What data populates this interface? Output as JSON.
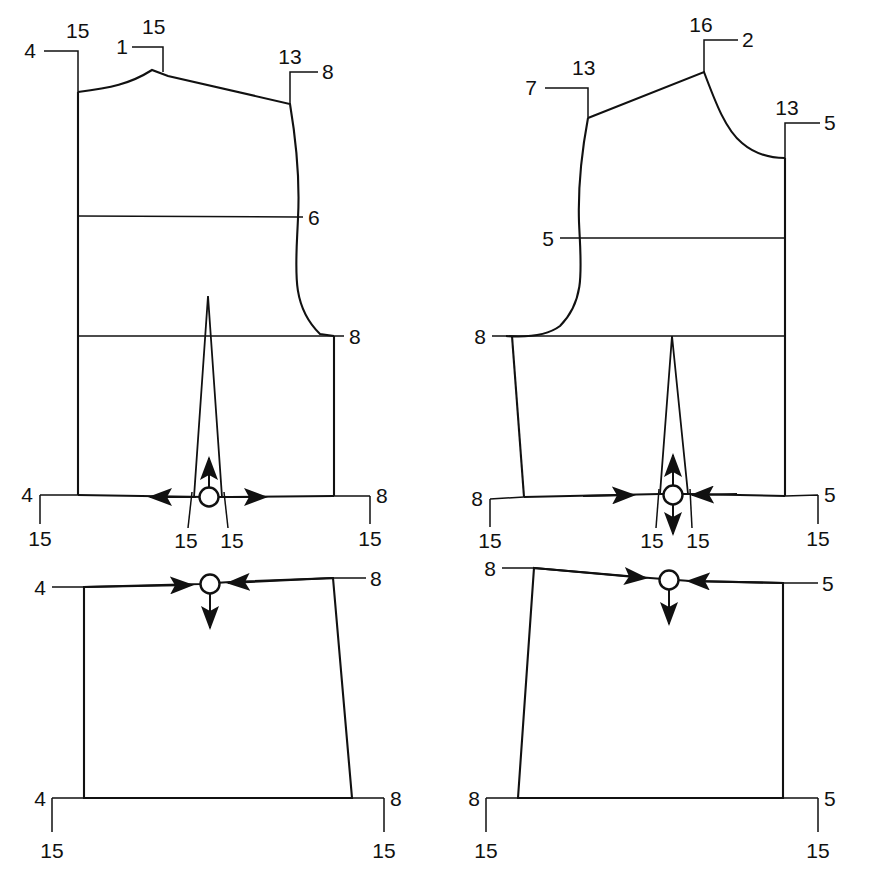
{
  "document": {
    "kind": "sewing-pattern-technical-drawing",
    "background_color": "#ffffff",
    "line_color": "#111111"
  },
  "pieces": [
    {
      "id": "front-bodice",
      "name": "Front bodice block",
      "position": "top-left",
      "callouts": [
        {
          "id": "fb-shoulder-left",
          "number": "4",
          "sub": "15"
        },
        {
          "id": "fb-center-front",
          "number": "1",
          "sub": "15"
        },
        {
          "id": "fb-shoulder-right",
          "number": "13",
          "sub": "8"
        },
        {
          "id": "fb-bust-line",
          "number": "6",
          "sub": ""
        },
        {
          "id": "fb-armhole-base",
          "number": "8",
          "sub": ""
        },
        {
          "id": "fb-waist-left",
          "number": "4",
          "sub": "15"
        },
        {
          "id": "fb-dart-left",
          "number": "",
          "sub": "15"
        },
        {
          "id": "fb-dart-right",
          "number": "",
          "sub": "15"
        },
        {
          "id": "fb-waist-right",
          "number": "8",
          "sub": "15"
        }
      ],
      "grain_marker": {
        "id": "fb-grain",
        "shape": "circle",
        "arrows": [
          "left",
          "right",
          "up"
        ]
      },
      "dart": {
        "id": "fb-waist-dart",
        "type": "waist-dart"
      }
    },
    {
      "id": "back-bodice",
      "name": "Back bodice block",
      "position": "top-right",
      "callouts": [
        {
          "id": "bb-neck-top",
          "number": "16",
          "sub": "2"
        },
        {
          "id": "bb-shoulder-left",
          "number": "7",
          "sub": "13"
        },
        {
          "id": "bb-neck-right",
          "number": "13",
          "sub": "5"
        },
        {
          "id": "bb-bust-line",
          "number": "5",
          "sub": ""
        },
        {
          "id": "bb-armhole-base",
          "number": "8",
          "sub": ""
        },
        {
          "id": "bb-waist-left",
          "number": "8",
          "sub": "15"
        },
        {
          "id": "bb-dart-left",
          "number": "",
          "sub": "15"
        },
        {
          "id": "bb-dart-right",
          "number": "",
          "sub": "15"
        },
        {
          "id": "bb-waist-right",
          "number": "5",
          "sub": "15"
        }
      ],
      "grain_marker": {
        "id": "bb-grain",
        "shape": "circle",
        "arrows": [
          "right-inward",
          "left-inward",
          "up",
          "down"
        ]
      },
      "dart": {
        "id": "bb-waist-dart",
        "type": "waist-dart"
      }
    },
    {
      "id": "front-skirt",
      "name": "Front skirt / lower panel",
      "position": "bottom-left",
      "callouts": [
        {
          "id": "fs-top-left",
          "number": "4",
          "sub": ""
        },
        {
          "id": "fs-top-right",
          "number": "8",
          "sub": ""
        },
        {
          "id": "fs-hem-left",
          "number": "4",
          "sub": "15"
        },
        {
          "id": "fs-hem-right",
          "number": "8",
          "sub": "15"
        }
      ],
      "grain_marker": {
        "id": "fs-grain",
        "shape": "circle",
        "arrows": [
          "right-inward",
          "left-inward",
          "down"
        ]
      }
    },
    {
      "id": "back-skirt",
      "name": "Back skirt / lower panel",
      "position": "bottom-right",
      "callouts": [
        {
          "id": "bs-top-left",
          "number": "8",
          "sub": ""
        },
        {
          "id": "bs-top-right",
          "number": "5",
          "sub": ""
        },
        {
          "id": "bs-hem-left",
          "number": "8",
          "sub": "15"
        },
        {
          "id": "bs-hem-right",
          "number": "5",
          "sub": "15"
        }
      ],
      "grain_marker": {
        "id": "bs-grain",
        "shape": "circle",
        "arrows": [
          "right-inward",
          "left-inward",
          "down"
        ]
      }
    }
  ],
  "labels": {
    "fb_shoulder_left_num": "4",
    "fb_shoulder_left_sub": "15",
    "fb_center_num": "1",
    "fb_center_sub": "15",
    "fb_shoulder_right_num": "13",
    "fb_shoulder_right_sub": "8",
    "fb_bust": "6",
    "fb_armhole": "8",
    "fb_waist_left_num": "4",
    "fb_waist_left_sub": "15",
    "fb_dart_left_sub": "15",
    "fb_dart_right_sub": "15",
    "fb_waist_right_num": "8",
    "fb_waist_right_sub": "15",
    "bb_neck_num": "16",
    "bb_neck_sub": "2",
    "bb_shoulder_left_num": "7",
    "bb_shoulder_left_sub": "13",
    "bb_neck_right_num": "13",
    "bb_neck_right_sub": "5",
    "bb_bust": "5",
    "bb_armhole": "8",
    "bb_waist_left_num": "8",
    "bb_waist_left_sub": "15",
    "bb_dart_left_sub": "15",
    "bb_dart_right_sub": "15",
    "bb_waist_right_num": "5",
    "bb_waist_right_sub": "15",
    "fs_top_left": "4",
    "fs_top_right": "8",
    "fs_hem_left_num": "4",
    "fs_hem_left_sub": "15",
    "fs_hem_right_num": "8",
    "fs_hem_right_sub": "15",
    "bs_top_left": "8",
    "bs_top_right": "5",
    "bs_hem_left_num": "8",
    "bs_hem_left_sub": "15",
    "bs_hem_right_num": "5",
    "bs_hem_right_sub": "15"
  }
}
